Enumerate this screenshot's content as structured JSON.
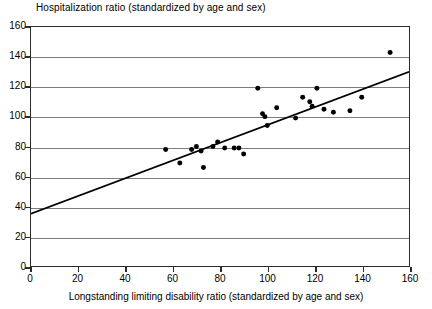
{
  "chart_data": {
    "type": "scatter",
    "title": "Hospitalization ratio (standardized by age and sex)",
    "xlabel": "Longstanding limiting disability ratio (standardized by age and sex)",
    "ylabel": "Hospitalization ratio (standardized by age and sex)",
    "xlim": [
      0,
      160
    ],
    "ylim": [
      0,
      160
    ],
    "xticks": [
      0,
      20,
      40,
      60,
      80,
      100,
      120,
      140,
      160
    ],
    "yticks": [
      0,
      20,
      40,
      60,
      80,
      100,
      120,
      140,
      160
    ],
    "grid": "horizontal",
    "legend": "none",
    "marker_color": "#000000",
    "line_color": "#000000",
    "grid_color": "#7d7d7d",
    "axis_color": "#2b2b2b",
    "points": [
      {
        "x": 57,
        "y": 78
      },
      {
        "x": 63,
        "y": 69
      },
      {
        "x": 68,
        "y": 78
      },
      {
        "x": 70,
        "y": 80
      },
      {
        "x": 72,
        "y": 77
      },
      {
        "x": 73,
        "y": 66
      },
      {
        "x": 77,
        "y": 80
      },
      {
        "x": 79,
        "y": 83
      },
      {
        "x": 82,
        "y": 79
      },
      {
        "x": 86,
        "y": 79
      },
      {
        "x": 88,
        "y": 79
      },
      {
        "x": 90,
        "y": 75
      },
      {
        "x": 96,
        "y": 119
      },
      {
        "x": 98,
        "y": 102
      },
      {
        "x": 99,
        "y": 100
      },
      {
        "x": 100,
        "y": 94
      },
      {
        "x": 104,
        "y": 106
      },
      {
        "x": 112,
        "y": 99
      },
      {
        "x": 115,
        "y": 113
      },
      {
        "x": 118,
        "y": 110
      },
      {
        "x": 119,
        "y": 107
      },
      {
        "x": 121,
        "y": 119
      },
      {
        "x": 124,
        "y": 105
      },
      {
        "x": 128,
        "y": 103
      },
      {
        "x": 135,
        "y": 104
      },
      {
        "x": 140,
        "y": 113
      },
      {
        "x": 152,
        "y": 143
      }
    ],
    "trendline": {
      "x0": 0,
      "y0": 35,
      "x1": 160,
      "y1": 130
    }
  }
}
